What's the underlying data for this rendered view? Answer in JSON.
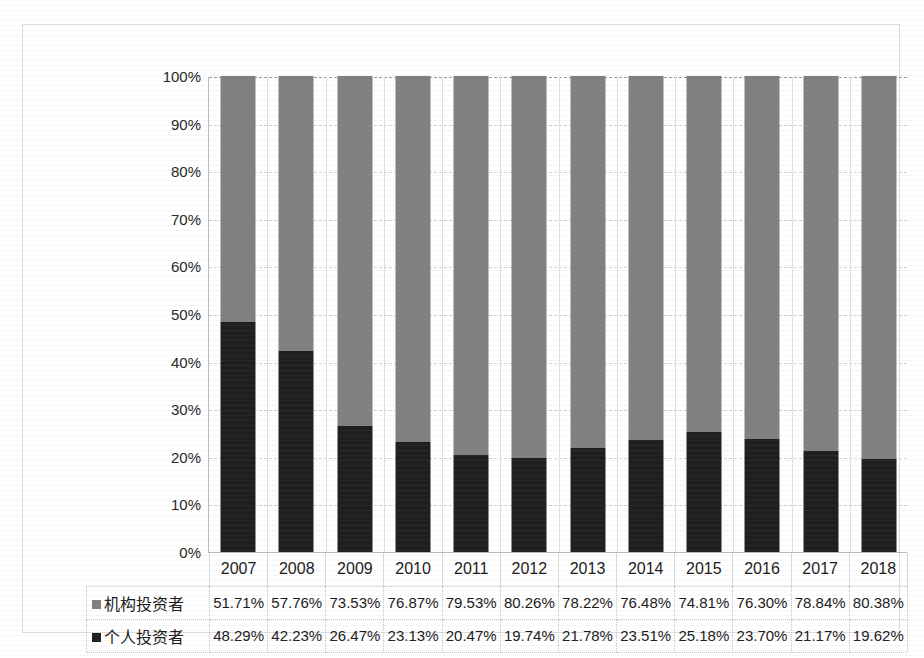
{
  "title": "",
  "chart_data": {
    "type": "bar",
    "subtype": "stacked-100-percent-column",
    "title": "",
    "xlabel": "",
    "ylabel": "",
    "ylim": [
      0,
      100
    ],
    "ytick_labels": [
      "100%",
      "90%",
      "80%",
      "70%",
      "60%",
      "50%",
      "40%",
      "30%",
      "20%",
      "10%",
      "0%"
    ],
    "ytick_values": [
      100,
      90,
      80,
      70,
      60,
      50,
      40,
      30,
      20,
      10,
      0
    ],
    "grid": true,
    "legend_position": "data-table",
    "categories": [
      "2007",
      "2008",
      "2009",
      "2010",
      "2011",
      "2012",
      "2013",
      "2014",
      "2015",
      "2016",
      "2017",
      "2018"
    ],
    "series": [
      {
        "name": "机构投资者",
        "color": "#808080",
        "stack_position": "top",
        "values": [
          51.71,
          57.76,
          73.53,
          76.87,
          79.53,
          80.26,
          78.22,
          76.48,
          74.81,
          76.3,
          78.84,
          80.38
        ],
        "labels": [
          "51.71%",
          "57.76%",
          "73.53%",
          "76.87%",
          "79.53%",
          "80.26%",
          "78.22%",
          "76.48%",
          "74.81%",
          "76.30%",
          "78.84%",
          "80.38%"
        ]
      },
      {
        "name": "个人投资者",
        "color": "#1f1f1f",
        "stack_position": "bottom",
        "values": [
          48.29,
          42.23,
          26.47,
          23.13,
          20.47,
          19.74,
          21.78,
          23.51,
          25.18,
          23.7,
          21.17,
          19.62
        ],
        "labels": [
          "48.29%",
          "42.23%",
          "26.47%",
          "23.13%",
          "20.47%",
          "19.74%",
          "21.78%",
          "23.51%",
          "25.18%",
          "23.70%",
          "21.17%",
          "19.62%"
        ]
      }
    ]
  },
  "table": {
    "corner_label": "",
    "column_headers": [
      "2007",
      "2008",
      "2009",
      "2010",
      "2011",
      "2012",
      "2013",
      "2014",
      "2015",
      "2016",
      "2017",
      "2018"
    ],
    "rows": [
      {
        "label": "机构投资者",
        "marker_color": "#808080",
        "cells": [
          "51.71%",
          "57.76%",
          "73.53%",
          "76.87%",
          "79.53%",
          "80.26%",
          "78.22%",
          "76.48%",
          "74.81%",
          "76.30%",
          "78.84%",
          "80.38%"
        ]
      },
      {
        "label": "个人投资者",
        "marker_color": "#1f1f1f",
        "cells": [
          "48.29%",
          "42.23%",
          "26.47%",
          "23.13%",
          "20.47%",
          "19.74%",
          "21.78%",
          "23.51%",
          "25.18%",
          "23.70%",
          "21.17%",
          "19.62%"
        ]
      }
    ]
  }
}
